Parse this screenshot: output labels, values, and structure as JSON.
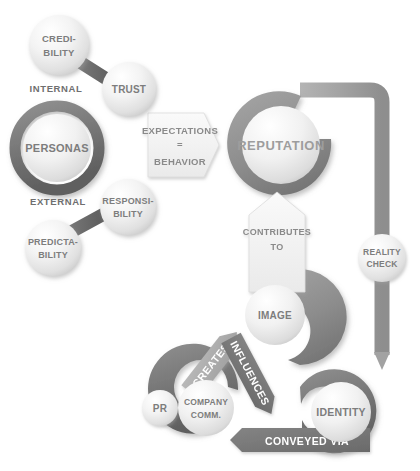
{
  "diagram": {
    "background": "#ffffff",
    "colors": {
      "pipe_light": "#a8a8a8",
      "pipe_dark": "#6f6f6f",
      "ring_dark": "#6b6b6b",
      "ring_mid": "#8f8f8f",
      "circle_light_top": "#fdfdfd",
      "circle_light_bottom": "#d4d4d4",
      "text_gray": "#7a7a7a",
      "banner_light": "#f2f2f2",
      "banner_dark": "#7a7a7a"
    }
  },
  "nodes": {
    "credibility": {
      "label_line1": "CREDI-",
      "label_line2": "BILITY"
    },
    "trust": {
      "label_line1": "TRUST",
      "label_line2": ""
    },
    "personas": {
      "label_line1": "PERSONAS",
      "label_line2": ""
    },
    "responsibility": {
      "label_line1": "RESPONSI-",
      "label_line2": "BILITY"
    },
    "predictability": {
      "label_line1": "PREDICTA-",
      "label_line2": "BILITY"
    },
    "reputation": {
      "label_line1": "REPUTATION",
      "label_line2": ""
    },
    "reality_check": {
      "label_line1": "REALITY",
      "label_line2": "CHECK"
    },
    "image": {
      "label_line1": "IMAGE",
      "label_line2": ""
    },
    "pr": {
      "label_line1": "PR",
      "label_line2": ""
    },
    "company_comm": {
      "label_line1": "COMPANY",
      "label_line2": "COMM."
    },
    "identity": {
      "label_line1": "IDENTITY",
      "label_line2": ""
    }
  },
  "axis_labels": {
    "internal": "INTERNAL",
    "external": "EXTERNAL"
  },
  "banners": {
    "expectations": {
      "line1": "EXPECTATIONS",
      "line2": "=",
      "line3": "BEHAVIOR",
      "direction": "right",
      "style": "light"
    },
    "contributes_to": {
      "line1": "CONTRIBUTES",
      "line2": "TO",
      "direction": "up",
      "style": "light"
    },
    "creates": {
      "line1": "CREATES",
      "direction": "up-right",
      "style": "light"
    },
    "influences": {
      "line1": "INFLUENCES",
      "direction": "down-right",
      "style": "dark"
    },
    "conveyed_via": {
      "line1": "CONVEYED VIA",
      "direction": "left",
      "style": "dark"
    }
  }
}
